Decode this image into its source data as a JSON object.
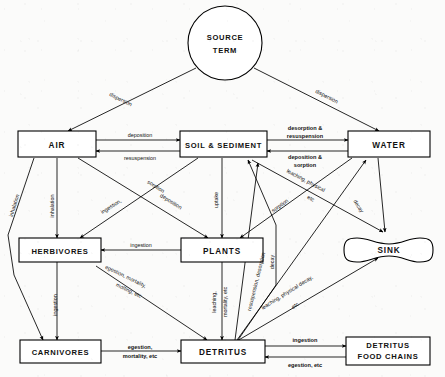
{
  "diagram": {
    "nodes": {
      "source_term": "SOURCE\nTERM",
      "source_term_line1": "SOURCE",
      "source_term_line2": "TERM",
      "air": "AIR",
      "soil_sediment": "SOIL & SEDIMENT",
      "water": "WATER",
      "herbivores": "HERBIVORES",
      "plants": "PLANTS",
      "sink": "SINK",
      "carnivores": "CARNIVORES",
      "detritus": "DETRITUS",
      "detritus_food_chains_line1": "DETRITUS",
      "detritus_food_chains_line2": "FOOD  CHAINS"
    },
    "edges": {
      "source_to_air": "dispersion",
      "source_to_water": "dispersion",
      "air_to_soil": "deposition",
      "soil_to_air": "resuspension",
      "soil_to_water_line1": "desorption &",
      "soil_to_water_line2": "resuspension",
      "water_to_soil_line1": "deposition &",
      "water_to_soil_line2": "sorption",
      "air_to_carnivores": "inhalation",
      "air_to_herbivores": "inhalation",
      "air_to_plants": "sorption",
      "soil_to_herbivores_line1": "ingestion,",
      "soil_to_herbivores_line2": "deposition",
      "soil_to_plants": "uptake",
      "water_to_plants": "sorption",
      "soil_to_sink_line1": "leaching, physical",
      "soil_to_sink_line2": "etc",
      "water_to_sink": "decay",
      "plants_to_herbivores": "ingestion",
      "soil_to_detritus": "decay",
      "plants_to_detritus_line1": "leaching,",
      "plants_to_detritus_line2": "mortality, etc",
      "herbivores_to_detritus_line1": "egestion, mortality,",
      "herbivores_to_detritus_line2": "molting, etc",
      "herbivores_to_carnivores": "ingestion",
      "detritus_to_soil_line1": "resuspension, desorption",
      "detritus_to_sink_line1": "leaching, physical decay,",
      "detritus_to_sink_line2": "etc",
      "carnivores_to_detritus_line1": "egestion,",
      "carnivores_to_detritus_line2": "mortality, etc",
      "detritus_to_chains": "ingestion",
      "chains_to_detritus": "egestion, etc"
    },
    "colors": {
      "ink": "#000000",
      "paper": "#fbfbfa",
      "box_fill": "#ffffff"
    }
  }
}
